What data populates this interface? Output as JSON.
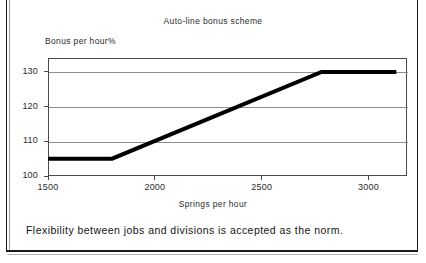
{
  "document": {
    "caption": "Flexibility between jobs and divisions is accepted as the norm."
  },
  "chart_data": {
    "type": "line",
    "title": "Auto-line bonus scheme",
    "xlabel": "Springs per hour",
    "ylabel": "Bonus per hour%",
    "xlim": [
      1500,
      3180
    ],
    "ylim": [
      100,
      134
    ],
    "grid": true,
    "legend": null,
    "xticks": [
      1500,
      2000,
      2500,
      3000
    ],
    "xtick_labels": [
      "1500",
      "2000",
      "2500",
      "3000"
    ],
    "yticks": [
      100,
      110,
      120,
      130
    ],
    "ytick_labels": [
      "100",
      "110",
      "120",
      "130"
    ],
    "series": [
      {
        "name": "Bonus per hour",
        "color": "#000000",
        "linewidth": 4,
        "x": [
          1500,
          1800,
          2780,
          3130
        ],
        "values": [
          105,
          105,
          130,
          130
        ]
      }
    ],
    "annotations": []
  }
}
